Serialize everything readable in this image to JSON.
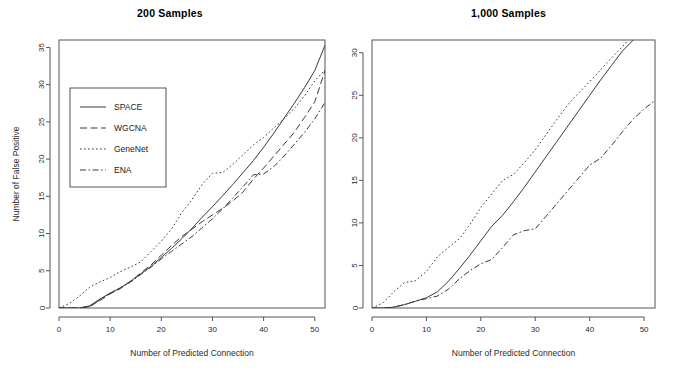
{
  "figure": {
    "xlabel": "Number of Predicted Connection",
    "ylabel": "Number of False Positive"
  },
  "legend": {
    "entries": [
      {
        "label": "SPACE",
        "style": "solid"
      },
      {
        "label": "WGCNA",
        "style": "dashed"
      },
      {
        "label": "GeneNet",
        "style": "dotted"
      },
      {
        "label": "ENA",
        "style": "dashdot"
      }
    ]
  },
  "chart_data": [
    {
      "type": "line",
      "title": "200 Samples",
      "xlabel": "Number of Predicted Connection",
      "ylabel": "Number of False Positive",
      "xlim": [
        0,
        52
      ],
      "ylim": [
        0,
        36
      ],
      "xticks": [
        0,
        10,
        20,
        30,
        40,
        50
      ],
      "yticks": [
        0,
        5,
        10,
        15,
        20,
        25,
        30,
        35
      ],
      "grid": false,
      "legend_position": "upper-left",
      "series": [
        {
          "name": "SPACE",
          "style": "solid",
          "x": [
            0,
            2,
            4,
            6,
            8,
            10,
            12,
            14,
            16,
            18,
            20,
            22,
            24,
            26,
            28,
            30,
            32,
            34,
            36,
            38,
            40,
            42,
            44,
            46,
            48,
            50,
            52
          ],
          "y": [
            0,
            0,
            0,
            0.3,
            1.2,
            2.0,
            2.7,
            3.6,
            4.6,
            5.6,
            6.8,
            8.0,
            9.3,
            10.7,
            12.2,
            13.6,
            15.1,
            16.6,
            18.2,
            19.8,
            21.6,
            23.5,
            25.5,
            27.5,
            29.6,
            31.9,
            35.3
          ]
        },
        {
          "name": "WGCNA",
          "style": "dashed",
          "x": [
            0,
            2,
            4,
            6,
            8,
            10,
            12,
            14,
            16,
            18,
            20,
            22,
            24,
            26,
            28,
            30,
            32,
            34,
            36,
            38,
            40,
            42,
            44,
            46,
            48,
            50,
            52
          ],
          "y": [
            0,
            0,
            0,
            0.2,
            1.0,
            1.9,
            2.6,
            3.6,
            4.7,
            5.8,
            7.1,
            8.4,
            9.6,
            10.6,
            11.6,
            12.5,
            13.4,
            14.4,
            15.6,
            17.3,
            18.8,
            20.4,
            22.0,
            23.6,
            25.6,
            27.7,
            31.9
          ]
        },
        {
          "name": "GeneNet",
          "style": "dotted",
          "x": [
            0,
            2,
            4,
            6,
            8,
            10,
            12,
            14,
            16,
            18,
            20,
            22,
            24,
            26,
            28,
            30,
            32,
            34,
            36,
            38,
            40,
            42,
            44,
            46,
            48,
            50,
            52
          ],
          "y": [
            0,
            0.6,
            1.6,
            2.8,
            3.5,
            4.1,
            4.9,
            5.5,
            6.2,
            7.6,
            9.0,
            10.6,
            12.8,
            14.6,
            16.6,
            18.1,
            18.2,
            19.3,
            20.6,
            21.9,
            22.9,
            24.2,
            25.4,
            26.8,
            28.5,
            30.5,
            32.0
          ]
        },
        {
          "name": "ENA",
          "style": "dashdot",
          "x": [
            0,
            2,
            4,
            6,
            8,
            10,
            12,
            14,
            16,
            18,
            20,
            22,
            24,
            26,
            28,
            30,
            32,
            34,
            36,
            38,
            40,
            42,
            44,
            46,
            48,
            50,
            52
          ],
          "y": [
            0,
            0,
            0,
            0.2,
            1.1,
            2.0,
            2.7,
            3.5,
            4.5,
            5.5,
            6.6,
            7.6,
            8.6,
            9.6,
            10.8,
            12.0,
            13.3,
            14.8,
            16.3,
            17.9,
            18.0,
            19.0,
            20.4,
            22.0,
            23.6,
            25.4,
            27.6
          ]
        }
      ]
    },
    {
      "type": "line",
      "title": "1,000 Samples",
      "xlabel": "Number of Predicted Connection",
      "ylabel": "",
      "xlim": [
        0,
        52
      ],
      "ylim": [
        0,
        31.5
      ],
      "xticks": [
        0,
        10,
        20,
        30,
        40,
        50
      ],
      "yticks": [
        0,
        5,
        10,
        15,
        20,
        25,
        30
      ],
      "grid": false,
      "legend_position": "none",
      "series": [
        {
          "name": "SPACE",
          "style": "solid",
          "x": [
            0,
            2,
            4,
            6,
            8,
            10,
            12,
            14,
            16,
            18,
            20,
            22,
            24,
            26,
            28,
            30,
            32,
            34,
            36,
            38,
            40,
            42,
            44,
            46,
            48
          ],
          "y": [
            0,
            0,
            0.1,
            0.4,
            0.8,
            1.2,
            1.9,
            3.1,
            4.6,
            6.2,
            7.9,
            9.6,
            10.9,
            12.5,
            14.2,
            16.0,
            17.8,
            19.6,
            21.4,
            23.2,
            25.0,
            26.8,
            28.5,
            30.2,
            31.5
          ]
        },
        {
          "name": "GeneNet",
          "style": "dotted",
          "x": [
            0,
            2,
            4,
            6,
            8,
            10,
            12,
            14,
            16,
            18,
            20,
            22,
            24,
            26,
            28,
            30,
            32,
            34,
            36,
            38,
            40,
            42,
            44,
            46,
            47
          ],
          "y": [
            0,
            0.6,
            1.9,
            3.0,
            3.2,
            4.3,
            6.0,
            7.1,
            8.1,
            9.8,
            11.8,
            13.4,
            15.0,
            15.7,
            17.1,
            18.6,
            20.4,
            22.2,
            23.9,
            25.3,
            26.6,
            28.0,
            29.4,
            30.7,
            31.4
          ]
        },
        {
          "name": "ENA",
          "style": "dashdot",
          "x": [
            0,
            2,
            4,
            6,
            8,
            10,
            12,
            14,
            16,
            18,
            20,
            22,
            24,
            26,
            28,
            30,
            32,
            34,
            36,
            38,
            40,
            42,
            44,
            46,
            48,
            50,
            52
          ],
          "y": [
            0,
            0,
            0.1,
            0.4,
            0.8,
            1.1,
            1.4,
            2.2,
            3.4,
            4.4,
            5.2,
            5.7,
            7.1,
            8.6,
            9.1,
            9.3,
            10.8,
            12.3,
            13.8,
            15.3,
            16.8,
            17.6,
            19.1,
            20.7,
            22.2,
            23.4,
            24.4
          ]
        }
      ]
    }
  ]
}
